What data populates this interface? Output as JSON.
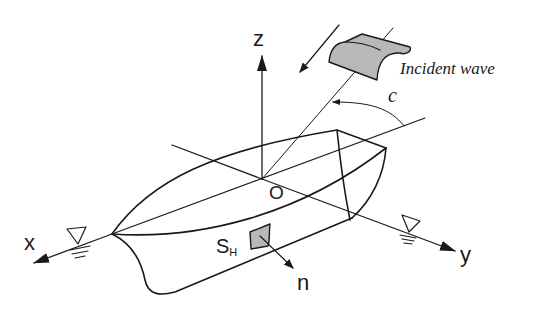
{
  "diagram": {
    "axes": {
      "x_label": "x",
      "y_label": "y",
      "z_label": "z",
      "origin_label": "O"
    },
    "wave": {
      "label": "Incident wave",
      "angle_label": "c"
    },
    "surface": {
      "label_main": "S",
      "label_sub": "H",
      "normal_label": "n"
    },
    "colors": {
      "line": "#1a1a1a",
      "patch_fill": "#b8b8b8",
      "background": "#ffffff"
    }
  }
}
